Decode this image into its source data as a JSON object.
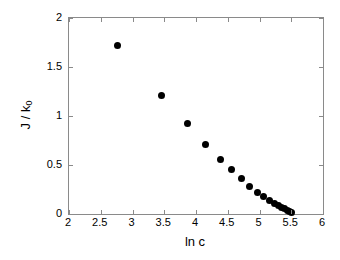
{
  "chart_data": {
    "type": "scatter",
    "title": "",
    "subtitle": "",
    "xlabel": "ln c",
    "ylabel": "J / k0",
    "ylabel_base": "J / k",
    "ylabel_sub": "0",
    "xlim": [
      2,
      6
    ],
    "ylim": [
      0,
      2
    ],
    "xticks": [
      2,
      2.5,
      3,
      3.5,
      4,
      4.5,
      5,
      5.5,
      6
    ],
    "xticklabels": [
      "2",
      "2.5",
      "3",
      "3.5",
      "4",
      "4.5",
      "5",
      "5.5",
      "6"
    ],
    "yticks": [
      0,
      0.5,
      1,
      1.5,
      2
    ],
    "yticklabels": [
      "0",
      "0.5",
      "1",
      "1.5",
      "2"
    ],
    "grid": false,
    "legend": null,
    "marker": "filled-circle",
    "marker_color": "#000000",
    "series": [
      {
        "name": "J / k0 vs ln c",
        "x": [
          2.77,
          3.46,
          3.87,
          4.15,
          4.38,
          4.56,
          4.72,
          4.85,
          4.97,
          5.07,
          5.16,
          5.24,
          5.3,
          5.35,
          5.4,
          5.44,
          5.47,
          5.5
        ],
        "y": [
          1.72,
          1.21,
          0.92,
          0.71,
          0.56,
          0.45,
          0.36,
          0.28,
          0.22,
          0.18,
          0.14,
          0.11,
          0.085,
          0.07,
          0.055,
          0.04,
          0.03,
          0.02
        ]
      }
    ]
  },
  "axes": {
    "frame_color": "#8a8a8a"
  }
}
